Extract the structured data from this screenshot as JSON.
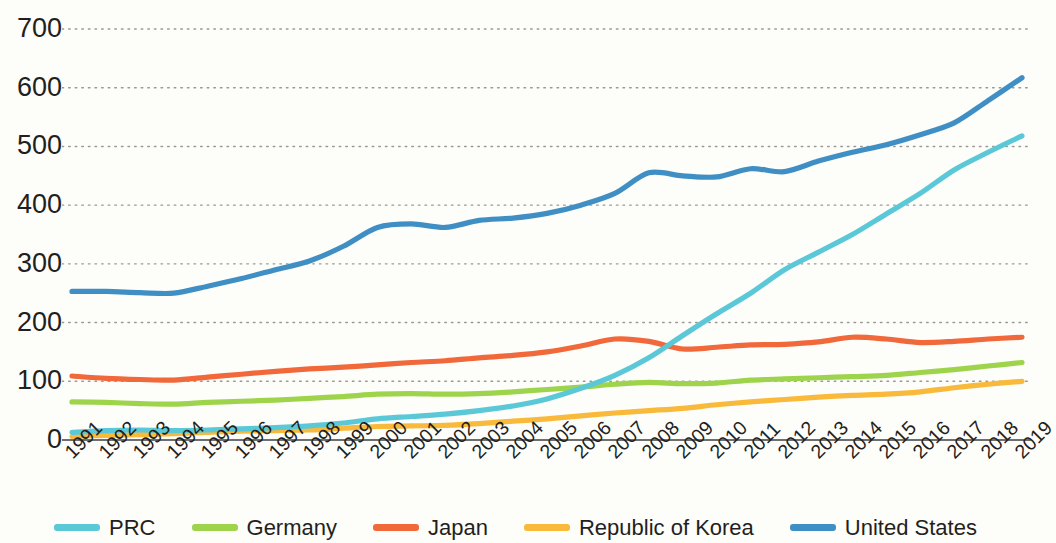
{
  "chart_data": {
    "type": "line",
    "title": "",
    "subtitle": "",
    "xlabel": "",
    "ylabel": "",
    "grid": true,
    "legend_position": "bottom",
    "ylim": [
      0,
      700
    ],
    "yticks": [
      0,
      100,
      200,
      300,
      400,
      500,
      600,
      700
    ],
    "x": [
      "1991",
      "1992",
      "1993",
      "1994",
      "1995",
      "1996",
      "1997",
      "1998",
      "1999",
      "2000",
      "2001",
      "2002",
      "2003",
      "2004",
      "2005",
      "2006",
      "2007",
      "2008",
      "2009",
      "2010",
      "2011",
      "2012",
      "2013",
      "2014",
      "2015",
      "2016",
      "2017",
      "2018",
      "2019"
    ],
    "series": [
      {
        "name": "PRC",
        "color": "#5bc8d8",
        "values": [
          13,
          16,
          17,
          16,
          17,
          19,
          21,
          24,
          29,
          36,
          40,
          44,
          50,
          58,
          70,
          88,
          110,
          140,
          178,
          215,
          250,
          290,
          320,
          350,
          385,
          420,
          460,
          490,
          518
        ]
      },
      {
        "name": "Germany",
        "color": "#9ed44c",
        "values": [
          65,
          64,
          62,
          61,
          64,
          66,
          68,
          71,
          74,
          78,
          79,
          78,
          79,
          82,
          86,
          90,
          95,
          98,
          96,
          97,
          102,
          104,
          106,
          108,
          110,
          115,
          120,
          126,
          132
        ]
      },
      {
        "name": "Japan",
        "color": "#f1683a",
        "values": [
          109,
          105,
          103,
          102,
          107,
          112,
          117,
          121,
          124,
          128,
          132,
          135,
          140,
          144,
          150,
          160,
          172,
          168,
          155,
          158,
          162,
          163,
          167,
          175,
          172,
          166,
          168,
          172,
          175
        ]
      },
      {
        "name": "Republic of Korea",
        "color": "#f9b93b",
        "values": [
          6,
          8,
          9,
          11,
          13,
          15,
          16,
          17,
          20,
          23,
          24,
          25,
          28,
          32,
          36,
          41,
          46,
          50,
          54,
          60,
          65,
          69,
          73,
          76,
          78,
          82,
          89,
          95,
          100
        ]
      },
      {
        "name": "United States",
        "color": "#3f8fc4",
        "values": [
          253,
          253,
          251,
          250,
          262,
          275,
          290,
          305,
          330,
          362,
          368,
          362,
          374,
          378,
          386,
          400,
          420,
          455,
          450,
          448,
          462,
          457,
          475,
          490,
          503,
          520,
          540,
          578,
          617
        ]
      }
    ]
  },
  "legend": {
    "items": [
      {
        "label": "PRC",
        "color": "#5bc8d8"
      },
      {
        "label": "Germany",
        "color": "#9ed44c"
      },
      {
        "label": "Japan",
        "color": "#f1683a"
      },
      {
        "label": "Republic of Korea",
        "color": "#f9b93b"
      },
      {
        "label": "United States",
        "color": "#3f8fc4"
      }
    ]
  },
  "axis": {
    "y_tick_labels": [
      "700",
      "600",
      "500",
      "400",
      "300",
      "200",
      "100",
      "0"
    ],
    "x_tick_labels": [
      "1991",
      "1992",
      "1993",
      "1994",
      "1995",
      "1996",
      "1997",
      "1998",
      "1999",
      "2000",
      "2001",
      "2002",
      "2003",
      "2004",
      "2005",
      "2006",
      "2007",
      "2008",
      "2009",
      "2010",
      "2011",
      "2012",
      "2013",
      "2014",
      "2015",
      "2016",
      "2017",
      "2018",
      "2019"
    ]
  }
}
